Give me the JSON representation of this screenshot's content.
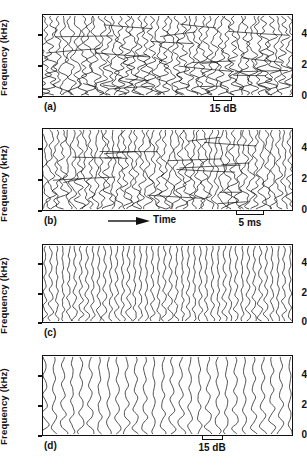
{
  "figure": {
    "type": "multi-panel-waterfall-spectrogram",
    "panel_count": 4
  },
  "axis": {
    "ylabel": "Frequency (kHz)",
    "yticks": [
      "0",
      "2",
      "4"
    ],
    "ytick_values": [
      0,
      2,
      4
    ],
    "ymin": 0,
    "ymax": 5.3
  },
  "panels": [
    {
      "label": "(a)",
      "scalebar": "15 dB",
      "has_scalebar": true,
      "has_time_axis": false,
      "trace_count": 40,
      "style": "dense-irregular"
    },
    {
      "label": "(b)",
      "scalebar": "5 ms",
      "has_scalebar": true,
      "has_time_axis": true,
      "time_label": "Time",
      "trace_count": 44,
      "style": "dense-wavy"
    },
    {
      "label": "(c)",
      "scalebar": "",
      "has_scalebar": false,
      "has_time_axis": false,
      "trace_count": 42,
      "style": "regular-wavy"
    },
    {
      "label": "(d)",
      "scalebar": "15 dB",
      "has_scalebar": true,
      "has_time_axis": false,
      "trace_count": 28,
      "style": "sparse-smooth"
    }
  ],
  "colors": {
    "line": "#111111",
    "background": "#ffffff",
    "axis": "#111111"
  },
  "chart_data": {
    "type": "line",
    "title": "",
    "xlabel": "Time",
    "ylabel": "Frequency (kHz)",
    "ylim": [
      0,
      5.3
    ],
    "grid": false,
    "legend": false,
    "panels": [
      {
        "name": "(a)",
        "yticks": [
          0,
          2,
          4
        ],
        "scale_annotation": "15 dB",
        "n_traces": 40
      },
      {
        "name": "(b)",
        "yticks": [
          0,
          2,
          4
        ],
        "scale_annotation": "5 ms",
        "time_annotation": "Time",
        "n_traces": 44
      },
      {
        "name": "(c)",
        "yticks": [
          0,
          2,
          4
        ],
        "scale_annotation": "",
        "n_traces": 42
      },
      {
        "name": "(d)",
        "yticks": [
          0,
          2,
          4
        ],
        "scale_annotation": "15 dB",
        "n_traces": 28
      }
    ]
  }
}
